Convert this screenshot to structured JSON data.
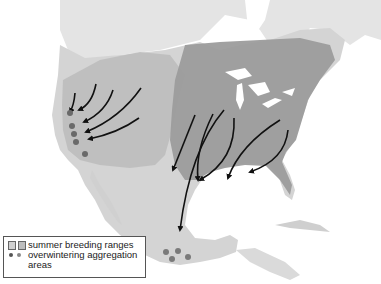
{
  "map": {
    "subject": "North America migration map",
    "colors": {
      "land": "#d6d6d6",
      "land_light": "#e6e6e6",
      "water": "#ffffff",
      "breeding_west": "#bdbdbd",
      "breeding_east": "#9a9a9a",
      "arrow": "#111111",
      "dot_dark": "#6a6a6a",
      "dot_light": "#8a8a8a"
    },
    "arrows_west": 5,
    "arrows_east": 6,
    "aggregation_sites_west": 5,
    "aggregation_sites_mexico": 4
  },
  "legend": {
    "items": [
      {
        "symbol": "squares",
        "label": "summer breeding ranges"
      },
      {
        "symbol": "dots",
        "label": "overwintering aggregation areas"
      }
    ]
  }
}
